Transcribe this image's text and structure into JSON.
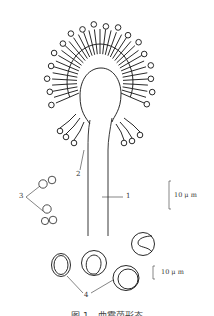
{
  "figure": {
    "labels": {
      "conidiophore": "1",
      "vesicle_phialides": "2",
      "conidia": "3",
      "cleistothecia": "4"
    },
    "scale_bars": [
      {
        "text": "10 μ m"
      },
      {
        "text": "10 μ m"
      }
    ],
    "caption": "图 1　曲霉菌形态"
  }
}
